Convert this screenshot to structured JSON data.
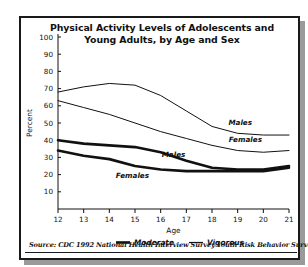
{
  "figure": {
    "title_line1": "Physical Activity Levels of Adolescents and",
    "title_line2": "Young Adults, by Age and Sex",
    "source": "Source: CDC 1992 National Health Interview Survey Youth Risk Behavior Survey",
    "frame_color": "#1a1a1a",
    "shadow_color": "#9a9a9a",
    "background": "#ffffff",
    "line_color": "#111111"
  },
  "chart_data": {
    "type": "line",
    "title": "Physical Activity Levels of Adolescents and Young Adults, by Age and Sex",
    "xlabel": "Age",
    "ylabel": "Percent",
    "x": [
      12,
      13,
      14,
      15,
      16,
      17,
      18,
      19,
      20,
      21
    ],
    "xlim": [
      12,
      21
    ],
    "ylim": [
      0,
      100
    ],
    "yticks": [
      0,
      10,
      20,
      30,
      40,
      50,
      60,
      70,
      80,
      90,
      100
    ],
    "xticks": [
      12,
      13,
      14,
      15,
      16,
      17,
      18,
      19,
      20,
      21
    ],
    "grid": false,
    "legend_position": "below-axis",
    "legend": [
      {
        "label": "Moderate",
        "style": "thick"
      },
      {
        "label": "Vigorous",
        "style": "thin"
      }
    ],
    "series": [
      {
        "name": "Vigorous Males",
        "activity": "Vigorous",
        "sex": "Males",
        "style": "thin",
        "inline_label": "Males",
        "values": [
          68,
          71,
          73,
          72,
          66,
          57,
          48,
          44,
          43,
          43
        ]
      },
      {
        "name": "Vigorous Females",
        "activity": "Vigorous",
        "sex": "Females",
        "style": "thin",
        "inline_label": "Females",
        "values": [
          63,
          59,
          55,
          50,
          45,
          41,
          37,
          34,
          33,
          34
        ]
      },
      {
        "name": "Moderate Males",
        "activity": "Moderate",
        "sex": "Males",
        "style": "thick",
        "inline_label": "Males",
        "values": [
          40,
          38,
          37,
          36,
          33,
          28,
          24,
          23,
          23,
          25
        ]
      },
      {
        "name": "Moderate Females",
        "activity": "Moderate",
        "sex": "Females",
        "style": "thick",
        "inline_label": "Females",
        "values": [
          34,
          31,
          29,
          25,
          23,
          22,
          22,
          22,
          22,
          24
        ]
      }
    ],
    "y_tick_labels": [
      "0",
      "10",
      "20",
      "30",
      "40",
      "50",
      "60",
      "70",
      "80",
      "90",
      "100"
    ],
    "x_tick_labels": [
      "12",
      "13",
      "14",
      "15",
      "16",
      "17",
      "18",
      "19",
      "20",
      "21"
    ],
    "annotations": [
      {
        "text": "Males",
        "series": "Vigorous Males",
        "x": 19.1,
        "y": 49
      },
      {
        "text": "Females",
        "series": "Vigorous Females",
        "x": 19.3,
        "y": 39
      },
      {
        "text": "Males",
        "series": "Moderate Males",
        "x": 16.5,
        "y": 30
      },
      {
        "text": "Females",
        "series": "Moderate Females",
        "x": 14.9,
        "y": 18
      }
    ]
  }
}
